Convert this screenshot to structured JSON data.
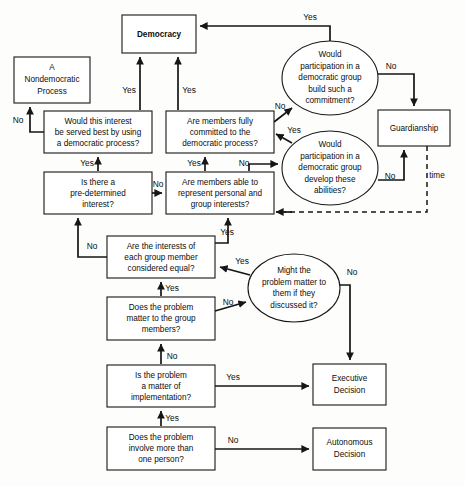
{
  "diagram": {
    "stroke_color": "#161616",
    "fill_color": "#ffffff",
    "background_color": "#fdfdfb"
  },
  "nodes": {
    "democracy": {
      "label": "Democracy",
      "shape": "rect"
    },
    "nondemocratic": {
      "line1": "A",
      "line2": "Nondemocratic",
      "line3": "Process",
      "shape": "rect"
    },
    "interest_served": {
      "line1": "Would this interest",
      "line2": "be served best by using",
      "line3": "a democratic process?",
      "shape": "rect"
    },
    "predetermined": {
      "line1": "Is there a",
      "line2": "pre-determined",
      "line3": "interest?",
      "shape": "rect"
    },
    "members_committed": {
      "line1": "Are members fully",
      "line2": "committed to the",
      "line3": "democratic process?",
      "shape": "rect"
    },
    "members_able": {
      "line1": "Are members able to",
      "line2": "represent personal and",
      "line3": "group interests?",
      "shape": "rect"
    },
    "build_commitment": {
      "line1": "Would",
      "line2": "participation in a",
      "line3": "democratic group",
      "line4": "build such a",
      "line5": "commitment?",
      "shape": "ellipse"
    },
    "develop_abilities": {
      "line1": "Would",
      "line2": "participation in a",
      "line3": "democratic group",
      "line4": "develop these",
      "line5": "abilities?",
      "shape": "ellipse"
    },
    "guardianship": {
      "label": "Guardianship",
      "shape": "rect"
    },
    "interests_equal": {
      "line1": "Are the interests of",
      "line2": "each  group member",
      "line3": "considered equal?",
      "shape": "rect"
    },
    "might_matter": {
      "line1": "Might the",
      "line2": "problem matter to",
      "line3": "them if they",
      "line4": "discussed it?",
      "shape": "ellipse"
    },
    "problem_matter": {
      "line1": "Does the problem",
      "line2": "matter to the group",
      "line3": "members?",
      "shape": "rect"
    },
    "implementation": {
      "line1": "Is the problem",
      "line2": "a matter of",
      "line3": "implementation?",
      "shape": "rect"
    },
    "more_than_one": {
      "line1": "Does the problem",
      "line2": "involve more than",
      "line3": "one person?",
      "shape": "rect"
    },
    "executive": {
      "line1": "Executive",
      "line2": "Decision",
      "shape": "rect"
    },
    "autonomous": {
      "line1": "Autonomous",
      "line2": "Decision",
      "shape": "rect"
    }
  },
  "edge_labels": {
    "build_to_democracy": "Yes",
    "build_to_guardianship": "No",
    "committed_to_build": "No",
    "committed_to_democracy": "Yes",
    "develop_to_committed": "Yes",
    "develop_to_guardianship": "No",
    "able_to_develop": "No",
    "able_to_committed": "Yes",
    "interest_to_nondemocratic": "No",
    "interest_to_democracy": "Yes",
    "predetermined_to_interest": "Yes",
    "predetermined_to_able": "No",
    "guardianship_time": "time",
    "equal_to_predetermined": "No",
    "equal_to_able": "Yes",
    "might_to_equal": "Yes",
    "might_to_executive": "No",
    "matter_to_equal": "Yes",
    "matter_to_might": "No",
    "implementation_to_matter": "No",
    "implementation_to_executive": "Yes",
    "morethanone_to_implementation": "Yes",
    "morethanone_to_autonomous": "No"
  }
}
